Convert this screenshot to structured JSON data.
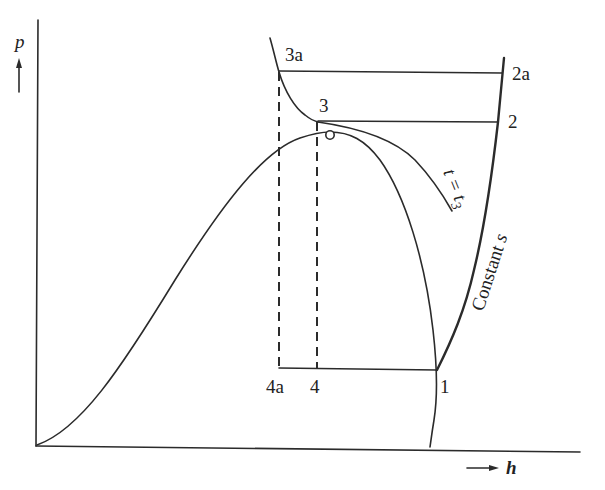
{
  "diagram": {
    "type": "p-h diagram (vapor compression refrigeration cycle)",
    "axes": {
      "y_label": "p",
      "x_label": "h"
    },
    "points": [
      {
        "id": "1",
        "label": "1"
      },
      {
        "id": "2",
        "label": "2"
      },
      {
        "id": "2a",
        "label": "2a"
      },
      {
        "id": "3",
        "label": "3"
      },
      {
        "id": "3a",
        "label": "3a"
      },
      {
        "id": "4",
        "label": "4"
      },
      {
        "id": "4a",
        "label": "4a"
      }
    ],
    "curve_labels": {
      "isotherm": "t = t",
      "isotherm_sub": "3",
      "isentrope": "Constant s"
    },
    "colors": {
      "ink": "#2b2b2b",
      "background": "#ffffff"
    }
  }
}
